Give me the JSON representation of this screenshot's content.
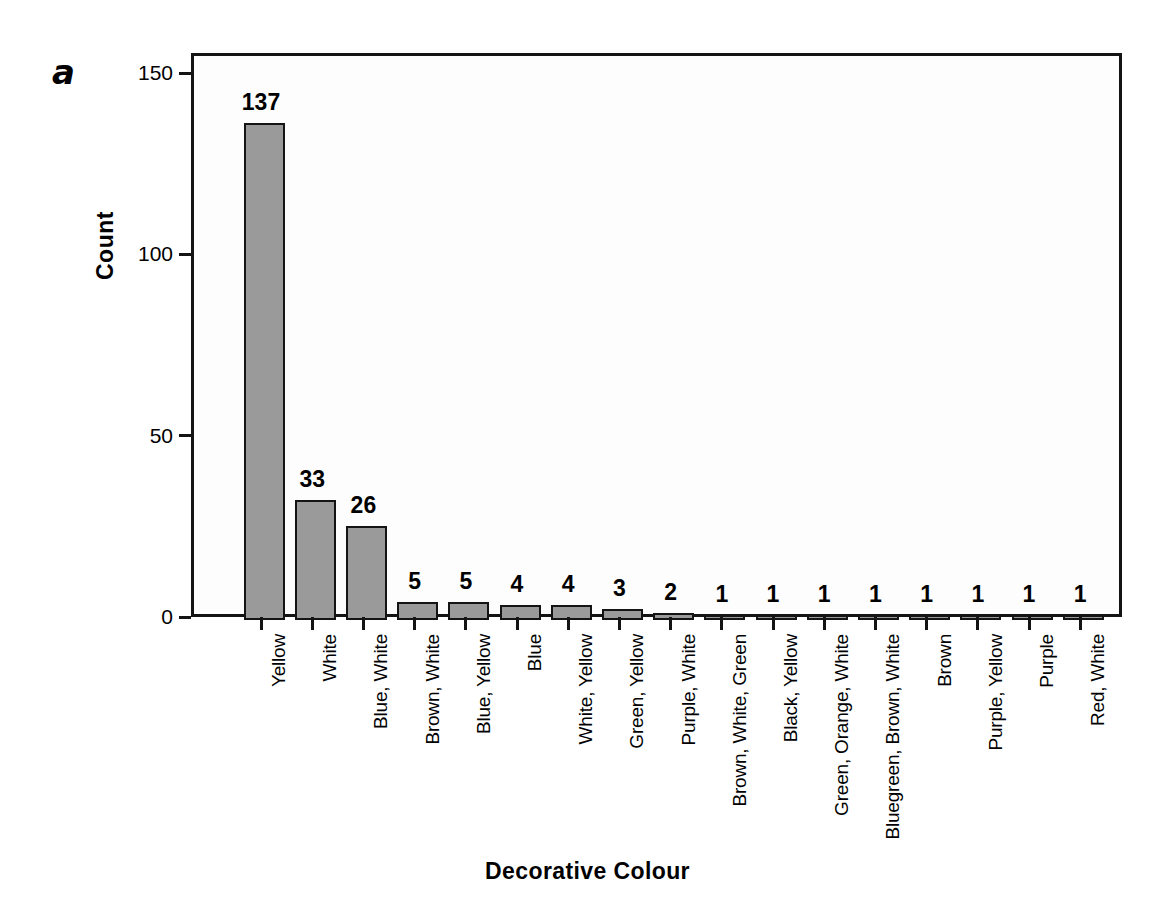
{
  "panel": {
    "label": "a"
  },
  "chart_data": {
    "type": "bar",
    "title": "",
    "xlabel": "Decorative Colour",
    "ylabel": "Count",
    "categories": [
      "Yellow",
      "White",
      "Blue, White",
      "Brown, White",
      "Blue, Yellow",
      "Blue",
      "White, Yellow",
      "Green, Yellow",
      "Purple, White",
      "Brown, White, Green",
      "Black, Yellow",
      "Green, Orange, White",
      "Bluegreen, Brown, White",
      "Brown",
      "Purple, Yellow",
      "Purple",
      "Red, White"
    ],
    "values": [
      137,
      33,
      26,
      5,
      5,
      4,
      4,
      3,
      2,
      1,
      1,
      1,
      1,
      1,
      1,
      1,
      1
    ],
    "ylim": [
      0,
      155
    ],
    "yticks": [
      0,
      50,
      100,
      150
    ],
    "ytick_labels": [
      "0",
      "50",
      "100",
      "150"
    ],
    "grid": false,
    "legend": null,
    "bar_color": "#9a9a9a",
    "bar_edge_color": "#141414",
    "show_value_labels": true
  }
}
